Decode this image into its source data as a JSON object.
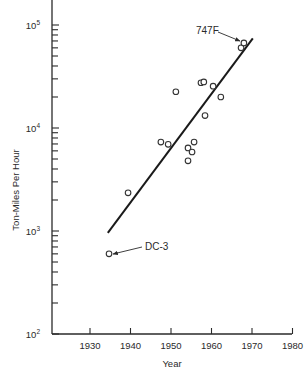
{
  "chart_data": {
    "type": "scatter",
    "title": "",
    "xlabel": "Year",
    "ylabel": "Ton-Miles Per Hour",
    "xlim": [
      1921,
      1980
    ],
    "ylim": [
      100,
      200000
    ],
    "yscale": "log",
    "grid": false,
    "legend": null,
    "x_ticks": [
      1930,
      1940,
      1950,
      1960,
      1970,
      1980
    ],
    "x_tick_labels": [
      "1930",
      "1940",
      "1950",
      "1960",
      "1970",
      "1980"
    ],
    "y_ticks": [
      100,
      1000,
      10000,
      100000
    ],
    "y_tick_labels": [
      {
        "base": "10",
        "exp": "2"
      },
      {
        "base": "10",
        "exp": "3"
      },
      {
        "base": "10",
        "exp": "4"
      },
      {
        "base": "10",
        "exp": "5"
      }
    ],
    "series": [
      {
        "name": "Aircraft",
        "marker": "open-circle",
        "points": [
          {
            "x": 1934.7,
            "y": 600,
            "label": "DC-3"
          },
          {
            "x": 1939.4,
            "y": 2350
          },
          {
            "x": 1947.5,
            "y": 7300
          },
          {
            "x": 1949.3,
            "y": 6950
          },
          {
            "x": 1951.2,
            "y": 22500
          },
          {
            "x": 1954.2,
            "y": 4800
          },
          {
            "x": 1954.2,
            "y": 6400
          },
          {
            "x": 1955.2,
            "y": 5850
          },
          {
            "x": 1955.7,
            "y": 7300
          },
          {
            "x": 1957.4,
            "y": 27500
          },
          {
            "x": 1958.1,
            "y": 28000
          },
          {
            "x": 1958.4,
            "y": 13200
          },
          {
            "x": 1960.4,
            "y": 25500
          },
          {
            "x": 1962.3,
            "y": 20000
          },
          {
            "x": 1967.3,
            "y": 60000
          },
          {
            "x": 1968.0,
            "y": 67000,
            "label": "747F"
          }
        ]
      },
      {
        "name": "Trend",
        "type": "line",
        "points": [
          {
            "x": 1934.4,
            "y": 960
          },
          {
            "x": 1970.2,
            "y": 74000
          }
        ]
      }
    ],
    "annotations": [
      {
        "text": "747F",
        "target_x": 1968.0,
        "target_y": 67000,
        "arrow": true
      },
      {
        "text": "DC-3",
        "target_x": 1934.7,
        "target_y": 600,
        "arrow": true
      }
    ]
  }
}
